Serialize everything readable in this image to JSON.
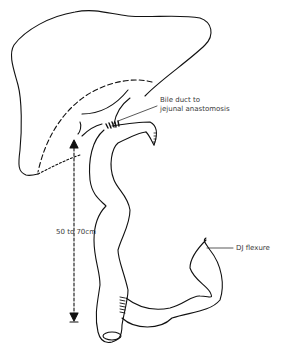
{
  "diagram": {
    "labels": {
      "anastomosis_line1": "Bile duct to",
      "anastomosis_line2": "jejunal anastomosis",
      "length": "50 to 70cm",
      "dj_flexure": "DJ flexure"
    },
    "colors": {
      "stroke": "#111111",
      "text": "#3a3a3a",
      "background": "#ffffff"
    }
  }
}
